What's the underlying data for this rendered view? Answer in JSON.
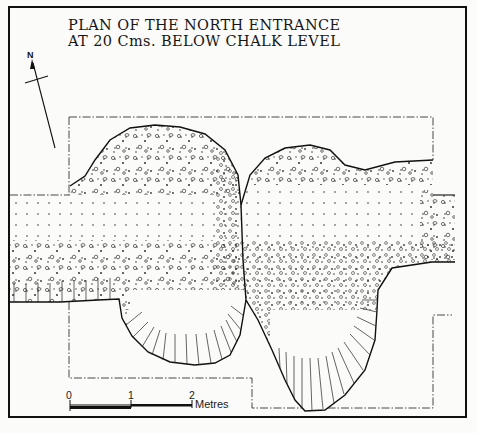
{
  "title": {
    "line1": "PLAN OF THE NORTH ENTRANCE",
    "line2": "AT 20 Cms. BELOW CHALK LEVEL"
  },
  "north_arrow": {
    "label": "N"
  },
  "scale_bar": {
    "ticks": [
      "0",
      "1",
      "2"
    ],
    "unit": "Metres"
  },
  "legend_features": {
    "dashed_boundary": "excavation limit",
    "dotted_fill": "chalk rubble",
    "hachured_edge": "ditch slope"
  },
  "colors": {
    "ink": "#111111",
    "paper": "#fbfbf9"
  }
}
